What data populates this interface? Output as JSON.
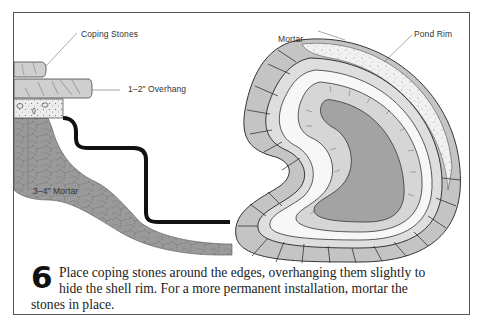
{
  "figure": {
    "step_number": "6",
    "caption_lines": [
      "Place coping stones around the edges, overhanging them slightly to",
      "hide the shell rim. For a more permanent installation, mortar the",
      "stones in place."
    ],
    "caption_full": "Place coping stones around the edges, overhanging them slightly to hide the shell rim. For a more permanent installation, mortar the stones in place."
  },
  "cross_section": {
    "labels": {
      "coping_stones": "Coping Stones",
      "overhang": "1–2\" Overhang",
      "mortar_depth": "3–4\" Mortar"
    }
  },
  "pond_view": {
    "labels": {
      "mortar": "Mortar",
      "pond_rim": "Pond Rim"
    }
  },
  "colors": {
    "frame_border": "#555555",
    "stone_fill": "#c9c9c9",
    "mortar_fill": "#8f8f8f",
    "water_fill": "#a3a3a3",
    "shell_line": "#111111"
  }
}
